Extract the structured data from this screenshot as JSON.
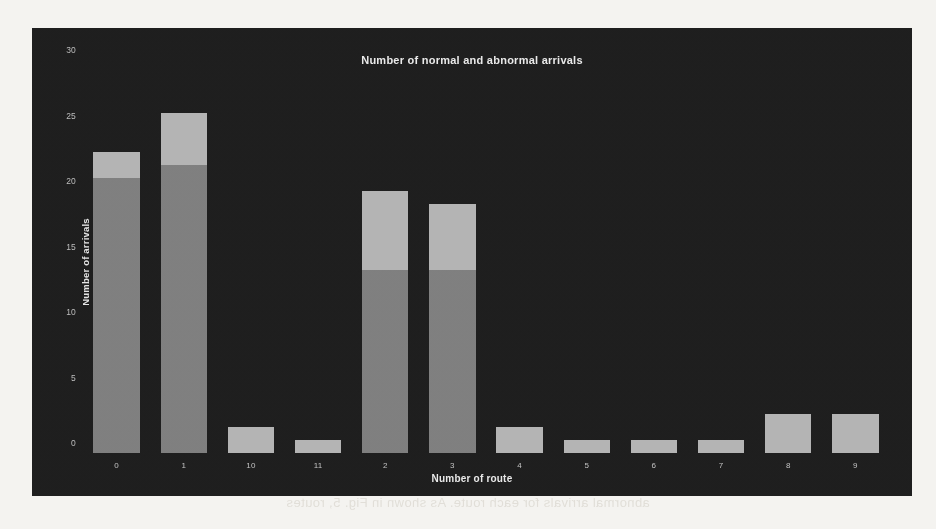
{
  "figure": {
    "title": "Number of normal and abnormal arrivals",
    "background_color": "#1c1c1c",
    "page_background_color": "#f4f3f0"
  },
  "page_bleed_text": "abnormal arrivals for each route. As shown in Fig. 5, routes",
  "chart_data": {
    "type": "bar",
    "subtype": "stacked-bar",
    "title": "Number of normal and abnormal arrivals",
    "xlabel": "Number of route",
    "ylabel": "Number of arrivals",
    "categories": [
      "0",
      "1",
      "10",
      "11",
      "2",
      "3",
      "4",
      "5",
      "6",
      "7",
      "8",
      "9"
    ],
    "series": [
      {
        "name": "normal",
        "color": "#7e7e7e",
        "values": [
          21,
          22,
          0,
          0,
          14,
          14,
          0,
          0,
          0,
          0,
          0,
          0
        ]
      },
      {
        "name": "abnormal",
        "color": "#b3b3b3",
        "values": [
          2,
          4,
          2,
          1,
          6,
          5,
          2,
          1,
          1,
          1,
          3,
          3
        ]
      }
    ],
    "totals": [
      23,
      26,
      2,
      1,
      20,
      19,
      2,
      1,
      1,
      1,
      3,
      3
    ],
    "ylim": [
      0,
      31
    ],
    "yticks": [
      0,
      5,
      10,
      15,
      20,
      25,
      30
    ],
    "ytick_labels": [
      "0",
      "5",
      "10",
      "15",
      "20",
      "25",
      "30"
    ],
    "grid": false,
    "legend": "none"
  }
}
